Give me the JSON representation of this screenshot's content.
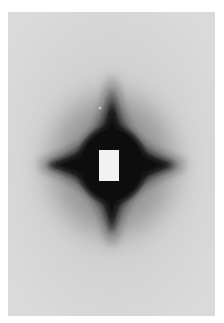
{
  "image": {
    "subject": "diffraction pattern",
    "description": "Grayscale photograph of a dark four-pointed star-shaped scattering pattern with a white rectangular beam stop at the center, on a light gray background with a white border.",
    "colors": {
      "border": "#ffffff",
      "background": "#d6d6d6",
      "pattern_dark": "#0e0e0e",
      "beam_stop": "#f2f2f2"
    }
  }
}
